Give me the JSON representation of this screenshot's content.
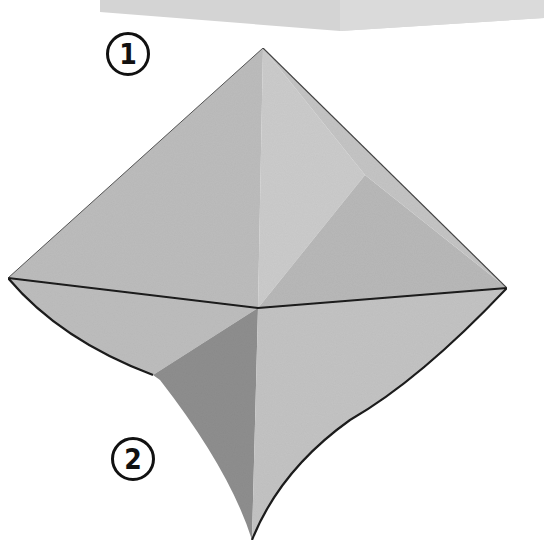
{
  "diagram": {
    "type": "origami-instruction",
    "steps": [
      {
        "label": "1"
      },
      {
        "label": "2"
      }
    ],
    "colors": {
      "background": "#ffffff",
      "paper_light": "#c9c9c9",
      "paper_mid": "#bdbdbd",
      "paper_dark": "#8f8f8f",
      "paper_top_box": "#d6d6d6",
      "edge_line": "#1a1a1a"
    }
  }
}
